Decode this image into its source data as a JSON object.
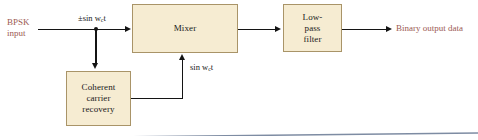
{
  "diagram": {
    "colors": {
      "block_fill": "#f6ecd2",
      "block_border": "#a99468",
      "wire": "#141414",
      "annotation_red": "#9c5a53",
      "baseline": "#7e8ca3"
    },
    "blocks": [
      {
        "id": "mixer",
        "label": "Mixer"
      },
      {
        "id": "lowpass",
        "line1": "Low-",
        "line2": "pass",
        "line3": "filter"
      },
      {
        "id": "carrier",
        "line1": "Coherent",
        "line2": "carrier",
        "line3": "recovery"
      }
    ],
    "labels": {
      "input_line1": "BPSK",
      "input_line2": "input",
      "signal_in_prefix": "±sin w",
      "signal_in_sub": "c",
      "signal_in_suffix": "t",
      "carrier_prefix": "sin w",
      "carrier_sub": "c",
      "carrier_suffix": "t",
      "output": "Binary output data"
    },
    "icons": {
      "junction": "junction-dot",
      "arrow_right": "arrowhead-right",
      "arrow_down": "arrowhead-down",
      "arrow_up": "arrowhead-up"
    }
  }
}
